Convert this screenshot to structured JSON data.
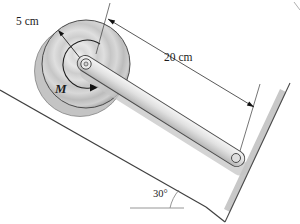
{
  "figure": {
    "type": "mechanics-incline-disk-rod-diagram",
    "labels": {
      "disk_radius": "5 cm",
      "rod_length": "20 cm",
      "moment": "M",
      "incline_angle": "30°"
    },
    "colors": {
      "line": "#3f3f3f",
      "dimension_line": "#3a3a3a",
      "guide_gray": "#8a8a8a",
      "disk_face_mid": "#d6d6d6",
      "disk_side": "#c4c4c4",
      "rod_fill": "#dcdcdc",
      "edge_shadow_band": "#c8c8c8",
      "background": "#ffffff"
    }
  }
}
